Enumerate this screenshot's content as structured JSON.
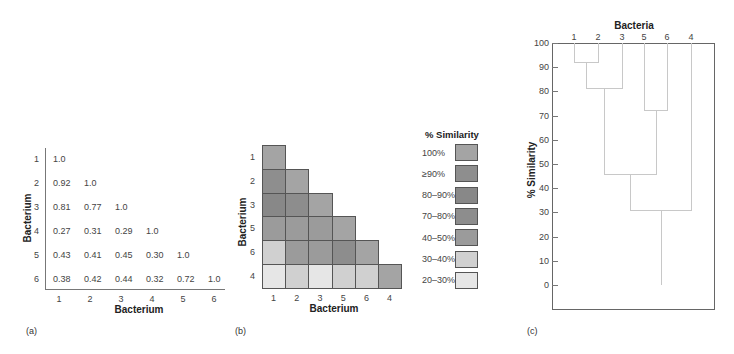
{
  "panel_a": {
    "label": "(a)",
    "x_axis_title": "Bacterium",
    "y_axis_title": "Bacterium",
    "row_labels": [
      "1",
      "2",
      "3",
      "4",
      "5",
      "6"
    ],
    "col_labels": [
      "1",
      "2",
      "3",
      "4",
      "5",
      "6"
    ],
    "matrix": [
      [
        "1.0"
      ],
      [
        "0.92",
        "1.0"
      ],
      [
        "0.81",
        "0.77",
        "1.0"
      ],
      [
        "0.27",
        "0.31",
        "0.29",
        "1.0"
      ],
      [
        "0.43",
        "0.41",
        "0.45",
        "0.30",
        "1.0"
      ],
      [
        "0.38",
        "0.42",
        "0.44",
        "0.32",
        "0.72",
        "1.0"
      ]
    ]
  },
  "panel_b": {
    "label": "(b)",
    "x_axis_title": "Bacterium",
    "y_axis_title": "Bacterium",
    "row_labels": [
      "1",
      "2",
      "3",
      "5",
      "6",
      "4"
    ],
    "col_labels": [
      "1",
      "2",
      "3",
      "5",
      "6",
      "4"
    ],
    "legend_title": "% Similarity",
    "legend": [
      {
        "label": "100%",
        "color": "#a4a4a4"
      },
      {
        "label": "≥90%",
        "color": "#8e8e8e"
      },
      {
        "label": "80–90%",
        "color": "#888888"
      },
      {
        "label": "70–80%",
        "color": "#8d8d8d"
      },
      {
        "label": "40–50%",
        "color": "#9b9b9b"
      },
      {
        "label": "30–40%",
        "color": "#d0d0d0"
      },
      {
        "label": "20–30%",
        "color": "#e6e6e6"
      }
    ],
    "cells": [
      [
        0
      ],
      [
        1,
        0
      ],
      [
        2,
        3,
        0
      ],
      [
        4,
        4,
        4,
        0
      ],
      [
        5,
        4,
        4,
        3,
        0
      ],
      [
        6,
        5,
        6,
        5,
        5,
        0
      ]
    ]
  },
  "panel_c": {
    "label": "(c)",
    "top_title": "Bacteria",
    "y_axis_title": "% Similarity",
    "leaf_labels": [
      "1",
      "2",
      "3",
      "5",
      "6",
      "4"
    ],
    "y_ticks": [
      "100",
      "90",
      "80",
      "70",
      "60",
      "50",
      "40",
      "30",
      "20",
      "10",
      "0"
    ]
  },
  "chart_data": [
    {
      "type": "table",
      "title": "(a) Similarity matrix",
      "xlabel": "Bacterium",
      "ylabel": "Bacterium",
      "rows": [
        "1",
        "2",
        "3",
        "4",
        "5",
        "6"
      ],
      "columns": [
        "1",
        "2",
        "3",
        "4",
        "5",
        "6"
      ],
      "values": [
        [
          1.0,
          null,
          null,
          null,
          null,
          null
        ],
        [
          0.92,
          1.0,
          null,
          null,
          null,
          null
        ],
        [
          0.81,
          0.77,
          1.0,
          null,
          null,
          null
        ],
        [
          0.27,
          0.31,
          0.29,
          1.0,
          null,
          null
        ],
        [
          0.43,
          0.41,
          0.45,
          0.3,
          1.0,
          null
        ],
        [
          0.38,
          0.42,
          0.44,
          0.32,
          0.72,
          1.0
        ]
      ]
    },
    {
      "type": "heatmap",
      "title": "(b) Reordered similarity matrix",
      "xlabel": "Bacterium",
      "ylabel": "Bacterium",
      "rows": [
        "1",
        "2",
        "3",
        "5",
        "6",
        "4"
      ],
      "columns": [
        "1",
        "2",
        "3",
        "5",
        "6",
        "4"
      ],
      "legend_title": "% Similarity",
      "legend": [
        "100%",
        "≥90%",
        "80–90%",
        "70–80%",
        "40–50%",
        "30–40%",
        "20–30%"
      ],
      "values": [
        [
          "100%"
        ],
        [
          "≥90%",
          "100%"
        ],
        [
          "80–90%",
          "70–80%",
          "100%"
        ],
        [
          "40–50%",
          "40–50%",
          "40–50%",
          "100%"
        ],
        [
          "30–40%",
          "40–50%",
          "40–50%",
          "70–80%",
          "100%"
        ],
        [
          "20–30%",
          "30–40%",
          "20–30%",
          "30–40%",
          "30–40%",
          "100%"
        ]
      ]
    },
    {
      "type": "dendrogram",
      "title": "(c) Dendrogram",
      "top_label": "Bacteria",
      "ylabel": "% Similarity",
      "ylim": [
        0,
        100
      ],
      "leaves": [
        "1",
        "2",
        "3",
        "5",
        "6",
        "4"
      ],
      "merges": [
        {
          "clusters": [
            "1",
            "2"
          ],
          "similarity": 92
        },
        {
          "clusters": [
            "1,2",
            "3"
          ],
          "similarity": 81
        },
        {
          "clusters": [
            "5",
            "6"
          ],
          "similarity": 72
        },
        {
          "clusters": [
            "1,2,3",
            "5,6"
          ],
          "similarity": 46
        },
        {
          "clusters": [
            "1,2,3,5,6",
            "4"
          ],
          "similarity": 31
        }
      ]
    }
  ]
}
